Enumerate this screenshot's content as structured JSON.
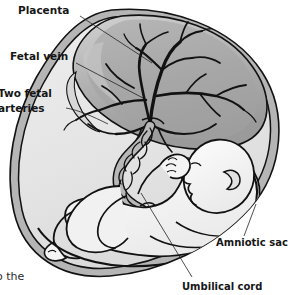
{
  "figure": {
    "type": "anatomical-illustration",
    "style": "grayscale line drawing"
  },
  "labels": {
    "placenta": "Placenta",
    "fetal_vein": "Fetal vein",
    "two_fetal_arteries_line1": "Two fetal",
    "two_fetal_arteries_line2": "arteries",
    "amniotic_sac": "Amniotic sac",
    "umbilical_cord": "Umbilical cord"
  },
  "caption": {
    "clipped_text": "o the"
  },
  "colors": {
    "background": "#ffffff",
    "outline": "#121212",
    "sac_fill": "#e6e6e6",
    "sac_rim": "#b9b9b9",
    "sac_rim_dark": "#9a9a9a",
    "placenta_light": "#c9c9c9",
    "placenta_mid": "#a8a8a8",
    "placenta_dark": "#8c8c8c",
    "vessel_fill": "#bdbdbd",
    "fetus_fill": "#f2f2f2",
    "fetus_shade": "#dcdcdc",
    "label_text": "#161616",
    "leader_line": "#222222"
  },
  "parts": {
    "placenta": "placenta",
    "fetus": "fetus",
    "umbilical_cord": "umbilical-cord",
    "amniotic_sac": "amniotic-sac",
    "vascular_tree": "vascular-tree"
  }
}
